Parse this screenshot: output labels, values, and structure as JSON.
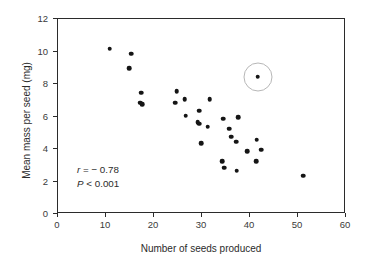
{
  "chart_data": {
    "type": "scatter",
    "title": "",
    "xlabel": "Number of seeds produced",
    "ylabel": "Mean mass per seed (mg)",
    "xlim": [
      0,
      60
    ],
    "ylim": [
      0,
      12
    ],
    "xticks": [
      0,
      10,
      20,
      30,
      40,
      50,
      60
    ],
    "yticks": [
      0,
      2,
      4,
      6,
      8,
      10,
      12
    ],
    "grid": false,
    "legend": null,
    "annotations": [
      {
        "text": "r = − 0.78",
        "x": 14,
        "y": 2.9
      },
      {
        "text": "P < 0.001",
        "x": 14,
        "y": 2.1
      }
    ],
    "correlation_r": -0.78,
    "p_value_text": "P < 0.001",
    "highlighted_point": {
      "x": 41.8,
      "y": 8.4,
      "marker": "open-circle-ring"
    },
    "points": [
      {
        "x": 11.0,
        "y": 10.1
      },
      {
        "x": 15.4,
        "y": 9.8
      },
      {
        "x": 15.1,
        "y": 8.9
      },
      {
        "x": 17.5,
        "y": 7.4
      },
      {
        "x": 17.3,
        "y": 6.8
      },
      {
        "x": 17.7,
        "y": 6.7
      },
      {
        "x": 24.6,
        "y": 6.8
      },
      {
        "x": 24.9,
        "y": 7.5
      },
      {
        "x": 26.6,
        "y": 7.0
      },
      {
        "x": 26.8,
        "y": 6.0
      },
      {
        "x": 29.6,
        "y": 6.3
      },
      {
        "x": 31.8,
        "y": 7.0
      },
      {
        "x": 29.3,
        "y": 5.6
      },
      {
        "x": 29.6,
        "y": 5.5
      },
      {
        "x": 31.4,
        "y": 5.3
      },
      {
        "x": 30.0,
        "y": 4.3
      },
      {
        "x": 34.6,
        "y": 5.8
      },
      {
        "x": 35.9,
        "y": 5.2
      },
      {
        "x": 36.3,
        "y": 4.7
      },
      {
        "x": 37.7,
        "y": 5.9
      },
      {
        "x": 37.3,
        "y": 4.4
      },
      {
        "x": 39.6,
        "y": 3.8
      },
      {
        "x": 41.6,
        "y": 4.5
      },
      {
        "x": 42.6,
        "y": 3.9
      },
      {
        "x": 41.5,
        "y": 3.2
      },
      {
        "x": 34.4,
        "y": 3.2
      },
      {
        "x": 34.8,
        "y": 2.8
      },
      {
        "x": 37.4,
        "y": 2.6
      },
      {
        "x": 41.8,
        "y": 8.4
      },
      {
        "x": 51.3,
        "y": 2.3
      }
    ]
  },
  "axes": {
    "y_tick_labels": [
      "0",
      "2",
      "4",
      "6",
      "8",
      "10",
      "12"
    ],
    "x_tick_labels": [
      "0",
      "10",
      "20",
      "30",
      "40",
      "50",
      "60"
    ],
    "y_title": "Mean mass per seed (mg)",
    "x_title": "Number of seeds produced"
  },
  "annotation": {
    "line1_var": "r",
    "line1_rest": " = − 0.78",
    "line2_var": "P",
    "line2_rest": " < 0.001"
  },
  "style": {
    "point_color": "#151515",
    "axis_color": "#2b2b2b",
    "ring_color": "#b7b7b7",
    "background": "#ffffff"
  }
}
